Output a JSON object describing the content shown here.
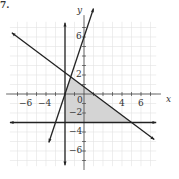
{
  "problem_number": "7.",
  "chart_data": {
    "type": "line",
    "title": "",
    "xlabel": "x",
    "ylabel": "y",
    "xlim": [
      -8,
      8
    ],
    "ylim": [
      -8,
      8
    ],
    "grid": true,
    "grid_step": 1,
    "x_tick_labels": [
      "-6",
      "-4",
      "0",
      "4",
      "6"
    ],
    "y_tick_labels": [
      "6",
      "2",
      "-2",
      "-4",
      "-6"
    ],
    "series": [
      {
        "name": "line-1",
        "equation": "y = 3x + 6",
        "x": [
          -3.7,
          1.0
        ],
        "y": [
          -5.1,
          9.0
        ]
      },
      {
        "name": "line-2",
        "equation": "x = -2",
        "x": [
          -2,
          -2
        ],
        "y": [
          -7.5,
          7.5
        ]
      },
      {
        "name": "line-3",
        "equation": "y = -3/4 x + 3/4",
        "x": [
          -7.6,
          7.4
        ],
        "y": [
          6.45,
          -4.8
        ]
      },
      {
        "name": "line-4",
        "equation": "y = -3",
        "x": [
          -7.8,
          7.6
        ],
        "y": [
          -3,
          -3
        ]
      }
    ],
    "shaded_region": {
      "vertices": [
        [
          -2,
          0
        ],
        [
          -1.4,
          1.8
        ],
        [
          5,
          -3
        ],
        [
          -2,
          -3
        ]
      ],
      "color": "#d4d4d4"
    }
  }
}
